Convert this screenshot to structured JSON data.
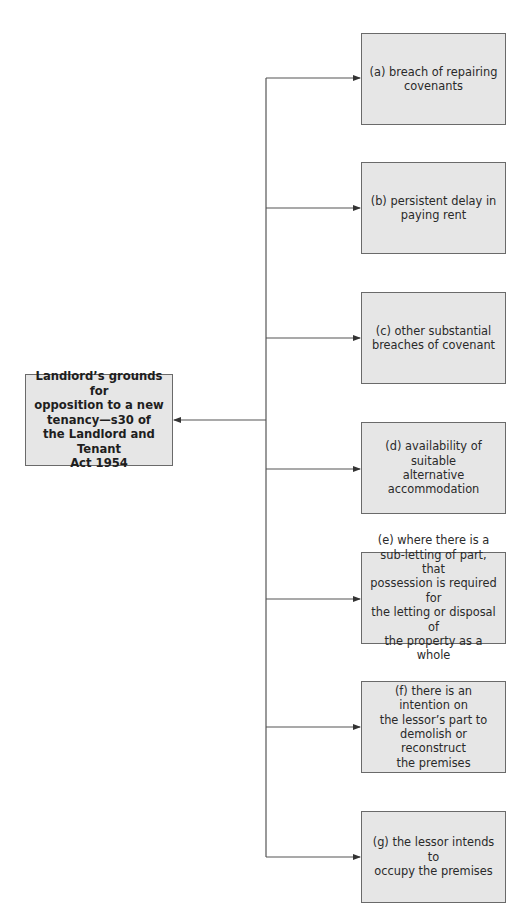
{
  "diagram": {
    "central": {
      "label": "Landlord’s grounds for opposition to a new tenancy—s30 of the Landlord and Tenant Act 1954",
      "lines": [
        "Landlord’s grounds for",
        "opposition to a new",
        "tenancy—s30 of",
        "the Landlord and Tenant",
        "Act 1954"
      ]
    },
    "grounds": [
      {
        "id": "a",
        "label": "(a) breach of repairing covenants",
        "lines": [
          "(a) breach of repairing",
          "covenants"
        ]
      },
      {
        "id": "b",
        "label": "(b) persistent delay in paying rent",
        "lines": [
          "(b) persistent delay in",
          "paying rent"
        ]
      },
      {
        "id": "c",
        "label": "(c) other substantial breaches of covenant",
        "lines": [
          "(c) other substantial",
          "breaches of covenant"
        ]
      },
      {
        "id": "d",
        "label": "(d) availability of suitable alternative accommodation",
        "lines": [
          "(d) availability of suitable",
          "alternative",
          "accommodation"
        ]
      },
      {
        "id": "e",
        "label": "(e) where there is a sub-letting of part, that possession is required for the letting or disposal of the property as a whole",
        "lines": [
          "(e) where there is a",
          "sub-letting of part, that",
          "possession is required for",
          "the letting or disposal of",
          "the property as a whole"
        ]
      },
      {
        "id": "f",
        "label": "(f) there is an intention on the lessor’s part to demolish or reconstruct the premises",
        "lines": [
          "(f) there is an intention on",
          "the lessor’s part to",
          "demolish or reconstruct",
          "the premises"
        ]
      },
      {
        "id": "g",
        "label": "(g) the lessor intends to occupy the premises",
        "lines": [
          "(g) the lessor intends to",
          "occupy the premises"
        ]
      }
    ],
    "colors": {
      "box_fill": "#e6e6e6",
      "box_border": "#6a6a6a",
      "connector": "#555555",
      "text": "#2a2a2a"
    }
  }
}
